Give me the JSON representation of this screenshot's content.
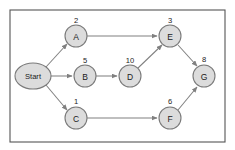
{
  "diagram": {
    "type": "directed-acyclic-graph",
    "frame": {
      "x": 10,
      "y": 10,
      "width": 215,
      "height": 132,
      "border_color": "#555555",
      "background_color": "#ffffff"
    },
    "style": {
      "node_fill": "#dcdcdc",
      "node_stroke": "#7a7a7a",
      "edge_color": "#808080",
      "text_color": "#1a1a1a"
    },
    "nodes": [
      {
        "id": "start",
        "label": "Start",
        "weight": "",
        "shape": "ellipse",
        "cx": 33,
        "cy": 76,
        "rx": 18,
        "ry": 13
      },
      {
        "id": "a",
        "label": "A",
        "weight": "2",
        "shape": "circle",
        "cx": 76,
        "cy": 36,
        "rx": 11,
        "ry": 11,
        "weight_x": 76,
        "weight_y": 20
      },
      {
        "id": "b",
        "label": "B",
        "weight": "5",
        "shape": "circle",
        "cx": 85,
        "cy": 76,
        "rx": 11,
        "ry": 11,
        "weight_x": 85,
        "weight_y": 60
      },
      {
        "id": "c",
        "label": "C",
        "weight": "1",
        "shape": "circle",
        "cx": 76,
        "cy": 118,
        "rx": 11,
        "ry": 11,
        "weight_x": 76,
        "weight_y": 101
      },
      {
        "id": "d",
        "label": "D",
        "weight": "10",
        "shape": "circle",
        "cx": 130,
        "cy": 76,
        "rx": 11,
        "ry": 11,
        "weight_x": 130,
        "weight_y": 60
      },
      {
        "id": "e",
        "label": "E",
        "weight": "3",
        "shape": "circle",
        "cx": 170,
        "cy": 36,
        "rx": 11,
        "ry": 11,
        "weight_x": 170,
        "weight_y": 20
      },
      {
        "id": "f",
        "label": "F",
        "weight": "6",
        "shape": "circle",
        "cx": 170,
        "cy": 118,
        "rx": 11,
        "ry": 11,
        "weight_x": 170,
        "weight_y": 101
      },
      {
        "id": "g",
        "label": "G",
        "weight": "8",
        "shape": "circle",
        "cx": 204,
        "cy": 76,
        "rx": 11,
        "ry": 11,
        "weight_x": 204,
        "weight_y": 59
      }
    ],
    "edges": [
      {
        "id": "start-a",
        "from": "start",
        "to": "a",
        "x1": 46,
        "y1": 67,
        "x2": 67,
        "y2": 44
      },
      {
        "id": "start-b",
        "from": "start",
        "to": "b",
        "x1": 51,
        "y1": 76,
        "x2": 72,
        "y2": 76
      },
      {
        "id": "start-c",
        "from": "start",
        "to": "c",
        "x1": 46,
        "y1": 85,
        "x2": 67,
        "y2": 110
      },
      {
        "id": "a-e",
        "from": "a",
        "to": "e",
        "x1": 87,
        "y1": 36,
        "x2": 157,
        "y2": 36
      },
      {
        "id": "b-d",
        "from": "b",
        "to": "d",
        "x1": 96,
        "y1": 76,
        "x2": 117,
        "y2": 76
      },
      {
        "id": "d-e",
        "from": "d",
        "to": "e",
        "x1": 138,
        "y1": 68,
        "x2": 162,
        "y2": 45
      },
      {
        "id": "c-f",
        "from": "c",
        "to": "f",
        "x1": 87,
        "y1": 118,
        "x2": 157,
        "y2": 118
      },
      {
        "id": "e-g",
        "from": "e",
        "to": "g",
        "x1": 178,
        "y1": 45,
        "x2": 197,
        "y2": 66
      },
      {
        "id": "f-g",
        "from": "f",
        "to": "g",
        "x1": 178,
        "y1": 110,
        "x2": 197,
        "y2": 87
      }
    ]
  }
}
